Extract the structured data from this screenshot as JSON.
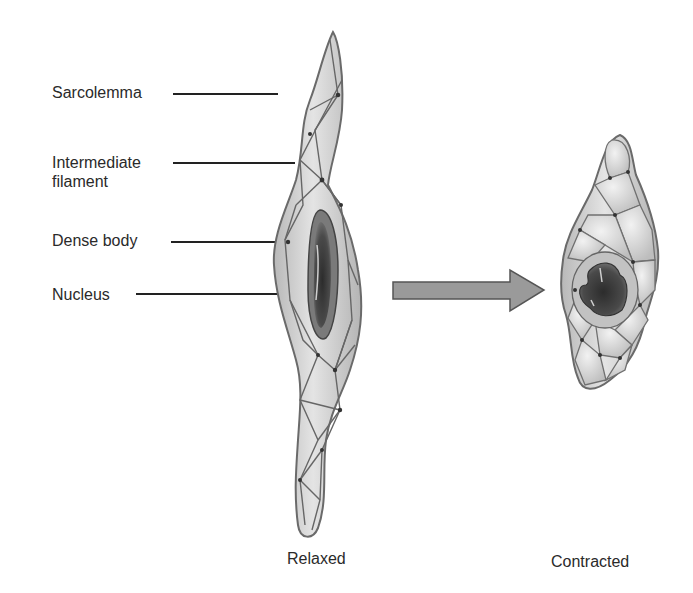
{
  "diagram": {
    "labels": [
      {
        "text": "Sarcolemma"
      },
      {
        "text": "Intermediate\nfilament",
        "line1": "Intermediate",
        "line2": "filament"
      },
      {
        "text": "Dense body"
      },
      {
        "text": "Nucleus"
      }
    ],
    "captions": {
      "relaxed": "Relaxed",
      "contracted": "Contracted"
    },
    "arrow": {
      "direction": "right",
      "meaning": "relaxed-to-contracted"
    },
    "colors": {
      "cell_fill": "#c9c9c9",
      "cell_highlight": "#e6e6e6",
      "cell_outline": "#6a6a6a",
      "nucleus_dark": "#3a3a3a",
      "nucleus_mid": "#6e6e6e",
      "arrow_fill": "#9a9a9a",
      "arrow_outline": "#555555"
    }
  }
}
